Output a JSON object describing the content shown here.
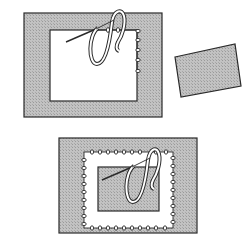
{
  "figure": {
    "colors": {
      "fabric_fill": "#b8b8b8",
      "line": "#2a2a2a",
      "window": "#ffffff",
      "thread_fill": "#ffffff"
    },
    "panels": [
      {
        "id": "step-1",
        "label": "Fabric frame with window being buttonhole-stitched along edge"
      },
      {
        "id": "patch",
        "label": "Separate tilted fabric patch"
      },
      {
        "id": "step-2",
        "label": "Patch placed in window, stitched all around"
      }
    ]
  }
}
